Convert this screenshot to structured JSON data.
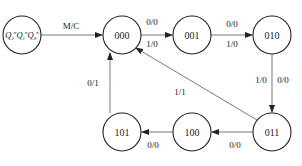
{
  "diagram": {
    "type": "state-transition-diagram",
    "legend_state": {
      "label": "Q2nQ1nQ0n",
      "display": "Q₂ⁿQ₁ⁿQ₀ⁿ",
      "edge_label": "M/C"
    },
    "states": [
      {
        "id": "s000",
        "label": "000"
      },
      {
        "id": "s001",
        "label": "001"
      },
      {
        "id": "s010",
        "label": "010"
      },
      {
        "id": "s011",
        "label": "011"
      },
      {
        "id": "s100",
        "label": "100"
      },
      {
        "id": "s101",
        "label": "101"
      }
    ],
    "transitions": [
      {
        "from": "000",
        "to": "001",
        "labels": [
          "0/0",
          "1/0"
        ]
      },
      {
        "from": "001",
        "to": "010",
        "labels": [
          "0/0",
          "1/0"
        ]
      },
      {
        "from": "010",
        "to": "011",
        "labels": [
          "1/0",
          "0/0"
        ]
      },
      {
        "from": "011",
        "to": "100",
        "labels": [
          "0/0"
        ]
      },
      {
        "from": "100",
        "to": "101",
        "labels": [
          "0/0"
        ]
      },
      {
        "from": "101",
        "to": "000",
        "labels": [
          "0/1"
        ]
      },
      {
        "from": "011",
        "to": "000",
        "labels": [
          "1/1"
        ]
      }
    ]
  }
}
